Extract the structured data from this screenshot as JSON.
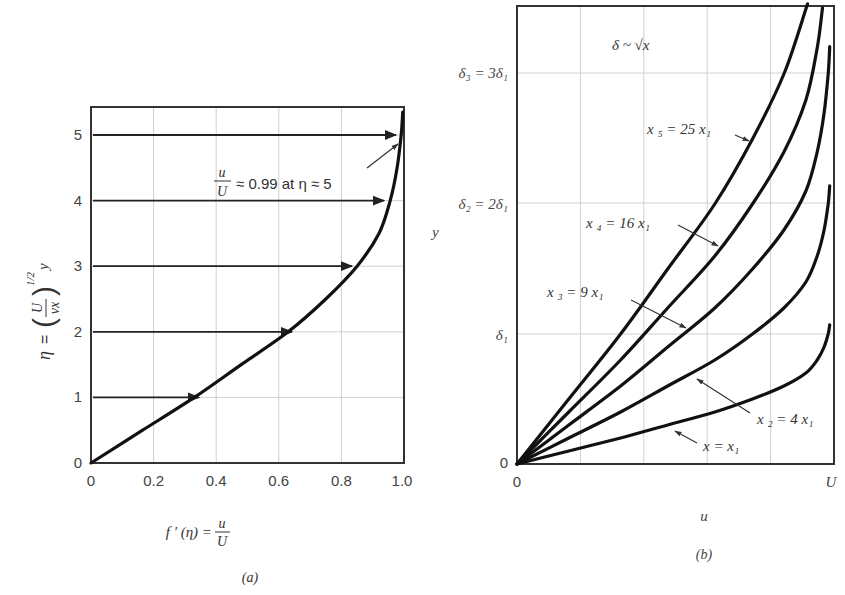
{
  "chart_data": [
    {
      "id": "a",
      "type": "line",
      "title": "",
      "caption": "(a)",
      "xlabel": "f ′ (η) = u/U",
      "ylabel": "η = (U/νx)^1/2 y",
      "xlim": [
        0,
        1.0
      ],
      "ylim": [
        0,
        5.43
      ],
      "xticks": [
        "0",
        "0.2",
        "0.4",
        "0.6",
        "0.8",
        "1.0"
      ],
      "yticks": [
        "0",
        "1",
        "2",
        "3",
        "4",
        "5"
      ],
      "grid": true,
      "series": [
        {
          "name": "Blasius velocity profile f′(η)",
          "x": [
            0,
            0.165,
            0.33,
            0.48,
            0.63,
            0.75,
            0.85,
            0.92,
            0.956,
            0.978,
            0.991,
            0.996
          ],
          "y": [
            0,
            0.5,
            1.0,
            1.5,
            2.0,
            2.5,
            3.0,
            3.5,
            4.0,
            4.5,
            5.0,
            5.35
          ]
        }
      ],
      "arrows": [
        {
          "eta": 1,
          "to_x": 0.33
        },
        {
          "eta": 2,
          "to_x": 0.65
        },
        {
          "eta": 3,
          "to_x": 0.83
        },
        {
          "eta": 4,
          "to_x": 0.93
        },
        {
          "eta": 5,
          "to_x": 0.97
        }
      ],
      "annotation": {
        "frac_num": "u",
        "frac_den": "U",
        "text": "≈ 0.99 at η ≈ 5"
      }
    },
    {
      "id": "b",
      "type": "line",
      "title": "",
      "caption": "(b)",
      "xlabel": "u",
      "ylabel": "y",
      "xticks": [
        "0",
        "U"
      ],
      "yticks": [
        "0",
        "δ1",
        "δ2 = 2δ1",
        "δ3 = 3δ1"
      ],
      "note": "δ ~ √x",
      "grid": true,
      "series": [
        {
          "name": "x = x1",
          "scale": 1
        },
        {
          "name": "x2 = 4 x1",
          "scale": 2
        },
        {
          "name": "x3 = 9 x1",
          "scale": 3
        },
        {
          "name": "x4 = 16 x1",
          "scale": 4
        },
        {
          "name": "x5 = 25 x1",
          "scale": 5
        }
      ]
    }
  ],
  "labels": {
    "a": {
      "ytick": [
        "0",
        "1",
        "2",
        "3",
        "4",
        "5"
      ],
      "xtick": [
        "0",
        "0.2",
        "0.4",
        "0.6",
        "0.8",
        "1.0"
      ],
      "ylabel_eta": "η",
      "ylabel_eq": "=",
      "ylabel_U": "U",
      "ylabel_nux": "νx",
      "ylabel_exp": "1/2",
      "ylabel_y": "y",
      "xlabel_f": "f ′ (η) =",
      "xlabel_u": "u",
      "xlabel_U": "U",
      "ann_u": "u",
      "ann_U": "U",
      "ann_text": "≈ 0.99 at η ≈ 5",
      "caption": "(a)"
    },
    "b": {
      "note": "δ ~ √x",
      "d3": "δ₃ = 3δ₁",
      "d2": "δ₂ = 2δ₁",
      "d1": "δ₁",
      "zero_y": "0",
      "zero_x": "0",
      "U": "U",
      "ylabel": "y",
      "xlabel": "u",
      "caption": "(b)",
      "x5": "x ₅ = 25 x₁",
      "x4": "x ₄ = 16 x₁",
      "x3": "x ₃ = 9 x₁",
      "x2": "x ₂ = 4 x₁",
      "x1": "x = x₁"
    }
  }
}
